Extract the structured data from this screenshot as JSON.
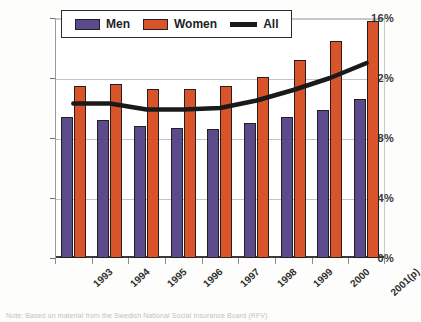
{
  "chart_data": {
    "type": "bar",
    "title": "",
    "xlabel": "",
    "ylabel": "",
    "ylim": [
      0,
      16
    ],
    "ytick_values": [
      0,
      4,
      8,
      12,
      16
    ],
    "ytick_labels": [
      "0%",
      "4%",
      "8%",
      "12%",
      "16%"
    ],
    "grid": true,
    "legend_position": "top",
    "categories": [
      "1993",
      "1994",
      "1995",
      "1996",
      "1997",
      "1998",
      "1999",
      "2000",
      "2001(p)"
    ],
    "series": [
      {
        "name": "Men",
        "type": "bar",
        "color": "#5B4A8C",
        "values": [
          9.4,
          9.2,
          8.8,
          8.7,
          8.6,
          9.0,
          9.4,
          9.9,
          10.6
        ]
      },
      {
        "name": "Women",
        "type": "bar",
        "color": "#D9542B",
        "values": [
          11.5,
          11.6,
          11.3,
          11.3,
          11.5,
          12.1,
          13.2,
          14.5,
          15.8
        ]
      },
      {
        "name": "All",
        "type": "line",
        "color": "#1a1a1a",
        "values": [
          10.3,
          10.3,
          9.9,
          9.9,
          10.0,
          10.5,
          11.2,
          12.0,
          13.0
        ]
      }
    ]
  },
  "legend": {
    "items": [
      {
        "label": "Men",
        "marker": "men-swatch"
      },
      {
        "label": "Women",
        "marker": "women-swatch"
      },
      {
        "label": "All",
        "marker": "all-line"
      }
    ]
  },
  "caption": {
    "text": "Note: Based on material from the Swedish National Social Insurance Board (RFV)"
  }
}
